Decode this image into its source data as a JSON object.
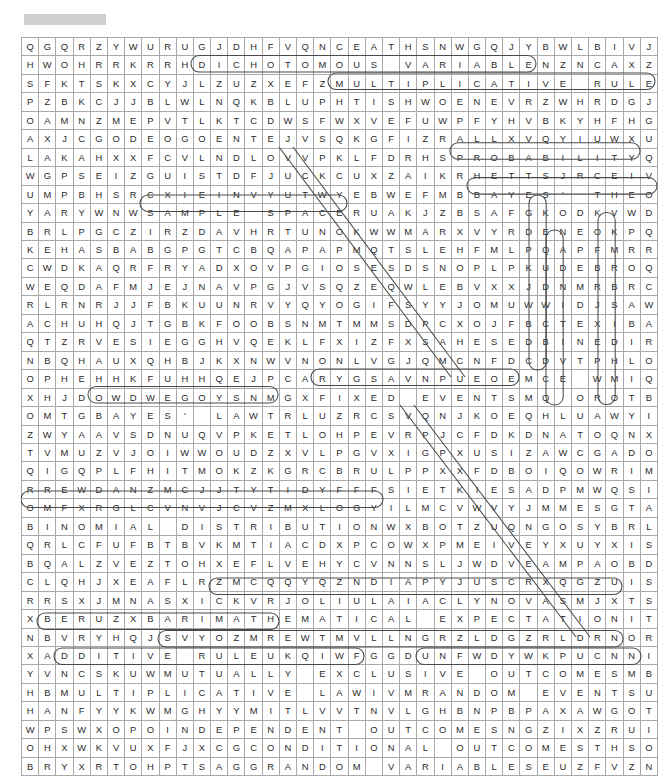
{
  "document": {
    "title_redacted": "",
    "title_visible": false
  },
  "puzzle": {
    "name": "probability-word-search",
    "columns": 37,
    "rows": 36,
    "cell_width_px": 17.2,
    "cell_height_px": 17.45,
    "grid_origin": {
      "x": 21,
      "y": 37
    },
    "letter_color": "#2b2b2b",
    "grid_line_color": "#a9a9a9",
    "answer_loop_color": "#4a4a4a",
    "redaction_color": "#cfcfcf",
    "rows_data": [
      "QGQRZYWURUGJDHFVQNCEATHSNWGQJYBWLBIVJRTC",
      "HWOHRRKRRHDICHOTOMOUS VARIABLENZNCAXZXED",
      "SFKTSKXCYJLZUZXEFZMULTIPLICATIVE RULEAWL",
      "PZBKCJJBLWLNQKBLUPHTISHWOENEVRZWHRDGJJQA",
      "OAMNZMEPVTLKTCDWSFWXVEFUWPFYHVBKYHFHGTWB",
      "AXJCGODEOGOENTEJVSQKGFIZRALLXVQYIUWXUCNH",
      "LAKAHXXFCVLNDLOVVPKLFDRHSPROBABILITYQQVT",
      "WGPSEIZGUISTDFJUCKCUXZAIKRHETTSJRCEIVFSI",
      "UMPBHSRCXIEINVYUTWYEBWEFMBBAYES' THEOREM",
      "YARYWNWSAMPLE SPACERUAKJZBSAFGKODKVWDKMX",
      "BRLPGCZIRZDAVHRTUNOKWWMARXVYRDENEOKPQVZI",
      "KEHASBABGPGTCBQAPAPMQTSLEHFMLPQAPFMRRKKJ",
      "CWDKAQRFRYADXOVPGIOSESDSNOPLPKUDEBROQGXS",
      "WEQDAFMJEJNAVPGJVSQZEQWLEBVXXJDNMRBRCSB",
      "RLRNRJJFBKUUNRVYQYOGIFSYYJOMUWWIDJSAWERK",
      "ACHUHQJTGBKFOOBSNMTMMSDPCXOJFBCTEXIBALXN",
      "QTZRVESIEGGHVQEKLFXIZFXSAHESEDBINEDIROCU",
      "NBQHAUXQHBJKXNWVNONLVGJQMCNFDCDVTPHLOKWJ",
      "OPHEHHKFUHHQEJPCARYGSAVNPUEOEMCE WMIQNCG",
      "XHJDOWDWEGOYSNMGXFIXED EVENTSMQ OROTBUOU",
      "OMTGBAYES' LAWTRLUZRCSVQNJKOEQHLUAWYIVMQ",
      "ZWYAAVSDNUQVPKETLOHPEVRPJCFDKDNATOQNXPP",
      "TVMUZVJOIWWOUDZXVLPGVXIGPXUSIZAWCGADOXLA",
      "QIGQPLFHITMOKZKGRCBRULPPXXFDBOIQOWRIMUEM",
      "RREWDANZMCJJTYTIDYFFFSIETKIESADPMWQSIMMS",
      "OMFXRGLCVNVJCVZMXLOGYILMCVWVYJMMESGTAFEF",
      "BINOMIAL DISTRIBUTIONWXBOTZUQNGOSYBRLXNB",
      "QRLCFUFBTBVKMTIACDXPCOWXPMEIVEYXUYXISTU",
      "BQALZVEZTOHXEFLVEHYCVNNSLJWDVEAMPAOBDZAL",
      "CLQHJXEAFLRZMCQQYQZNDIAPYJUSCRXQGZUISRS",
      "RRSXJMNASXICKVRJOLIULAIACLYNOVASMJXTSZYG",
      "XBERUZXBARIMATHEMATICAL EXPECTATIONITG A",
      "NBVRYHQJSVYOZMREWTMVLLNGRZLDGZRLDRNORAOZ",
      "XADDITIVE RULEUKQIWFGGDUNFWDYWKPUCNNIOUA",
      "YVNCSKUWMUTUALLY EXCLUSIVE OUTCOMESMBLTS",
      "HBMULTIPLICATIVE LAWIVMRANDOM EVENTSUOCF",
      "HANFYYKWMGHYYMITLVVTNVLGHBNPBPAXAWGOTMOT",
      "WPSWXOPOINDEPENDENT OUTCOMESNGZIXZRUISML",
      "OHXWKVUXFJXCGCONDITIONAL OUTCOMESTHSOYEF",
      "BRYXRTOHPTSAGGRANDOM VARIABLESEUZFVZNESX"
    ],
    "found_words": [
      "DICHOTOMOUS VARIABLE",
      "MULTIPLICATIVE RULE",
      "PROBABILITY",
      "BAYES' THEOREM",
      "SAMPLE SPACE",
      "DEPENDENT",
      "FIXED EVENTS",
      "BAYES' LAW",
      "BINOMIAL DISTRIBUTION",
      "MATHEMATICAL EXPECTATION",
      "ADDITIVE RULE",
      "MUTUALLY EXCLUSIVE OUTCOMES",
      "MULTIPLICATIVE LAW",
      "RANDOM EVENTS",
      "INDEPENDENT OUTCOMES",
      "CONDITIONAL OUTCOMES",
      "RANDOM VARIABLES"
    ]
  }
}
